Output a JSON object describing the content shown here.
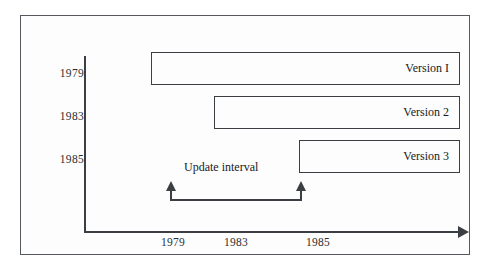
{
  "figure": {
    "axis": {
      "x_ticks": [
        "1979",
        "1983",
        "1985"
      ],
      "y_ticks": [
        "1979",
        "1983",
        "1985"
      ],
      "x_arrow_icon": "right-arrow-icon",
      "colors": {
        "line": "#3b3e42",
        "frame": "#55585c",
        "background": "#ffffff"
      }
    },
    "bars": [
      {
        "label": "Version I",
        "start_year": "1979",
        "row": "1979"
      },
      {
        "label": "Version 2",
        "start_year": "1983",
        "row": "1983"
      },
      {
        "label": "Version 3",
        "start_year": "1985",
        "row": "1985"
      }
    ],
    "annotation": {
      "label": "Update interval",
      "left_arrow_icon": "up-arrow-icon",
      "right_arrow_icon": "up-arrow-icon"
    }
  },
  "chart_data": {
    "type": "bar",
    "title": "",
    "xlabel": "",
    "ylabel": "",
    "categories": [
      "1979",
      "1983",
      "1985"
    ],
    "series": [
      {
        "name": "Version I",
        "start": 1979,
        "end": 1988
      },
      {
        "name": "Version 2",
        "start": 1983,
        "end": 1988
      },
      {
        "name": "Version 3",
        "start": 1985,
        "end": 1988
      }
    ],
    "x_tick_labels": [
      "1979",
      "1983",
      "1985"
    ],
    "y_tick_labels": [
      "1979",
      "1983",
      "1985"
    ],
    "annotations": [
      {
        "text": "Update interval",
        "from": "1979",
        "to": "1985"
      }
    ],
    "grid": false,
    "legend": "none"
  }
}
